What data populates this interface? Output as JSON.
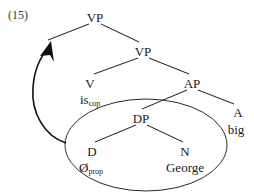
{
  "figure": {
    "example_number": "(15)",
    "type": "syntax-tree"
  },
  "tree": {
    "nodes": [
      {
        "id": "vp-top",
        "label": "VP",
        "x": 95,
        "y": 18
      },
      {
        "id": "vp-lower",
        "label": "VP",
        "x": 143,
        "y": 52
      },
      {
        "id": "v",
        "label": "V",
        "x": 90,
        "y": 84
      },
      {
        "id": "ap",
        "label": "AP",
        "x": 192,
        "y": 84
      },
      {
        "id": "dp",
        "label": "DP",
        "x": 141,
        "y": 119
      },
      {
        "id": "a",
        "label": "A",
        "x": 238,
        "y": 113
      },
      {
        "id": "d",
        "label": "D",
        "x": 92,
        "y": 152
      },
      {
        "id": "n",
        "label": "N",
        "x": 185,
        "y": 152
      }
    ],
    "terminals": [
      {
        "id": "is-cop",
        "base": "is",
        "sub": "cop",
        "x": 86,
        "y": 100
      },
      {
        "id": "big",
        "base": "big",
        "sub": "",
        "x": 236,
        "y": 130
      },
      {
        "id": "null-prop",
        "base": "Ø",
        "sub": "prop",
        "x": 87,
        "y": 168
      },
      {
        "id": "george",
        "base": "George",
        "sub": "",
        "x": 185,
        "y": 168
      }
    ],
    "branches": [
      {
        "id": "vptop-left",
        "from": "vp-top",
        "to": "trace-site"
      },
      {
        "id": "vptop-right",
        "from": "vp-top",
        "to": "vp-lower"
      },
      {
        "id": "vplow-left",
        "from": "vp-lower",
        "to": "v"
      },
      {
        "id": "vplow-right",
        "from": "vp-lower",
        "to": "ap"
      },
      {
        "id": "ap-left",
        "from": "ap",
        "to": "dp"
      },
      {
        "id": "ap-right",
        "from": "ap",
        "to": "a"
      },
      {
        "id": "dp-left",
        "from": "dp",
        "to": "d"
      },
      {
        "id": "dp-right",
        "from": "dp",
        "to": "n"
      }
    ],
    "constituent_circle": {
      "id": "dp-ellipse",
      "label": "DP constituent",
      "cx": 146,
      "cy": 145,
      "rx": 81,
      "ry": 46
    },
    "movement_arrow": {
      "id": "dp-movement",
      "label": "DP movement to specifier of VP",
      "from": "dp-ellipse-left-edge",
      "to": "vp-top-left-branch"
    }
  },
  "colors": {
    "ink": "#1a1a1a",
    "arrow": "#111111",
    "ellipse": "#2a2a2a",
    "background": "#ffffff"
  }
}
